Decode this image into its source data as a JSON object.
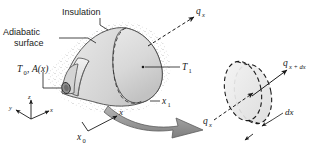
{
  "figure": {
    "background_color": "#ffffff",
    "body_fill": "#dcdcdc",
    "body_fill_light": "#ececec",
    "body_fill_dark": "#c6c6c6",
    "line_color": "#1a1a1a",
    "arrow_fill": "#9a9a9a"
  },
  "labels": {
    "insulation": "Insulation",
    "adiabatic_line1": "Adiabatic",
    "adiabatic_line2": "surface",
    "q_x_top": "q",
    "q_x_top_sub": "x",
    "T0": "T",
    "T0_sub": "0",
    "T0_comma": ",",
    "A_of_x": "A(x)",
    "T1": "T",
    "T1_sub": "1",
    "x1": "x",
    "x1_sub": "1",
    "q_x_arrow": "q",
    "q_x_arrow_sub": "x",
    "q_x_dx": "q",
    "q_x_dx_sub": "x + dx",
    "dx": "dx",
    "axis_x": "x",
    "axis_y": "y",
    "axis_z": "z",
    "x0": "x",
    "x0_sub": "0"
  }
}
